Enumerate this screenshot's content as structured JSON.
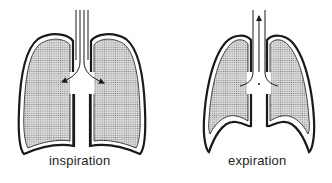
{
  "diagram": {
    "panels": [
      {
        "id": "inspiration",
        "label": "inspiration",
        "airflow": "inward",
        "arrow_direction": "into lungs (left and right bronchi)"
      },
      {
        "id": "expiration",
        "label": "expiration",
        "airflow": "outward",
        "arrow_direction": "up the trachea"
      }
    ],
    "colors": {
      "outline": "#1a1a1a",
      "stipple": "#8c8c8c",
      "background": "#ffffff"
    }
  }
}
